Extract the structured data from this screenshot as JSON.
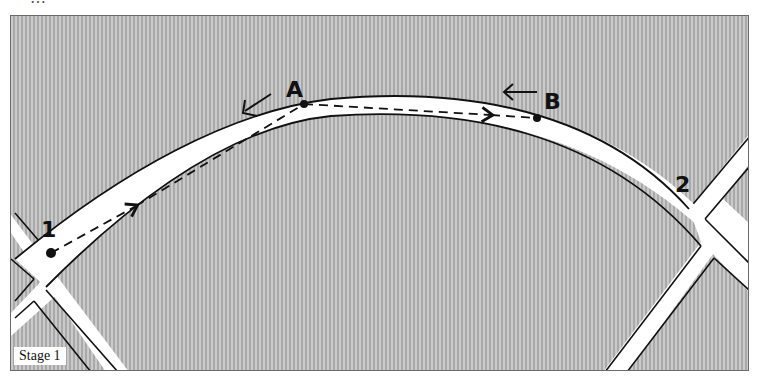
{
  "figure": {
    "top_caption_fragment": "…",
    "stage_label": "Stage 1",
    "points": [
      {
        "id": "1",
        "label": "1",
        "role": "start-intersection"
      },
      {
        "id": "A",
        "label": "A",
        "role": "apex-turn-in"
      },
      {
        "id": "B",
        "label": "B",
        "role": "exit-point"
      },
      {
        "id": "2",
        "label": "2",
        "role": "end-intersection"
      }
    ],
    "arrows": [
      {
        "near": "A",
        "direction": "down-left",
        "glyph": "↙"
      },
      {
        "near": "B",
        "direction": "left",
        "glyph": "←"
      }
    ],
    "path": "dashed line 1 → A → B",
    "colors": {
      "background_hatch": "#9a9a9a",
      "road": "#ffffff",
      "ink": "#111111",
      "frame_border": "#6b6b6b"
    }
  }
}
